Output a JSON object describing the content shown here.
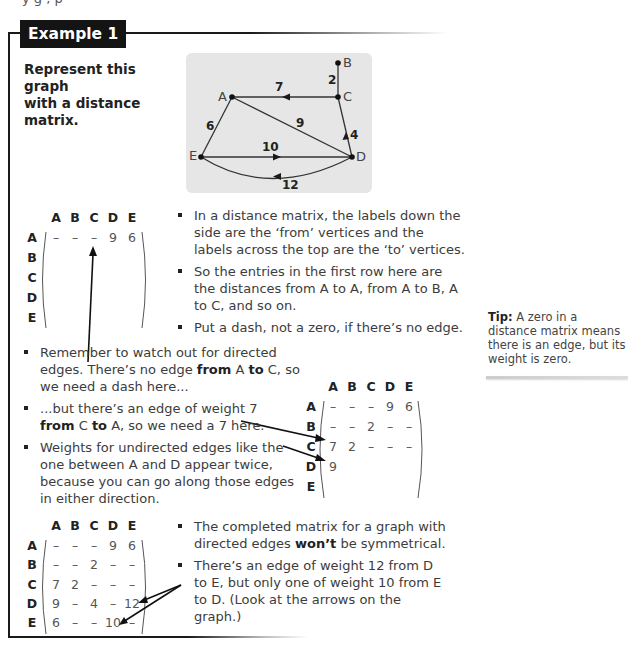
{
  "header": {
    "cut_text": "y g   ,           p",
    "example_label": "Example 1"
  },
  "prompt": {
    "line1": "Represent this graph",
    "line2": "with a distance matrix."
  },
  "graph": {
    "nodes": [
      {
        "id": "A",
        "x": 232,
        "y": 97
      },
      {
        "id": "B",
        "x": 338,
        "y": 63
      },
      {
        "id": "C",
        "x": 338,
        "y": 97
      },
      {
        "id": "D",
        "x": 352,
        "y": 157
      },
      {
        "id": "E",
        "x": 201,
        "y": 157
      }
    ],
    "edges": [
      {
        "from": "C",
        "to": "A",
        "weight": "7",
        "directed": true
      },
      {
        "from": "B",
        "to": "C",
        "weight": "2",
        "directed": false
      },
      {
        "from": "A",
        "to": "E",
        "weight": "6",
        "directed": false
      },
      {
        "from": "A",
        "to": "D",
        "weight": "9",
        "directed": false
      },
      {
        "from": "D",
        "to": "C",
        "weight": "4",
        "directed": true
      },
      {
        "from": "E",
        "to": "D",
        "weight": "10",
        "directed": true
      },
      {
        "from": "D",
        "to": "E",
        "weight": "12",
        "directed": true
      }
    ],
    "labels": {
      "A": "A",
      "B": "B",
      "C": "C",
      "D": "D",
      "E": "E"
    },
    "weights": {
      "ca": "7",
      "bc": "2",
      "ae": "6",
      "ad": "9",
      "dc": "4",
      "ed": "10",
      "de": "12"
    }
  },
  "matrix_headers": [
    "A",
    "B",
    "C",
    "D",
    "E"
  ],
  "matrix1": {
    "rows": [
      [
        "–",
        "–",
        "–",
        "9",
        "6"
      ],
      [
        "",
        "",
        "",
        "",
        ""
      ],
      [
        "",
        "",
        "",
        "",
        ""
      ],
      [
        "",
        "",
        "",
        "",
        ""
      ],
      [
        "",
        "",
        "",
        "",
        ""
      ]
    ]
  },
  "matrix2": {
    "rows": [
      [
        "–",
        "–",
        "–",
        "9",
        "6"
      ],
      [
        "–",
        "–",
        "2",
        "–",
        "–"
      ],
      [
        "7",
        "2",
        "–",
        "–",
        "–"
      ],
      [
        "9",
        "",
        "",
        "",
        ""
      ],
      [
        "",
        "",
        "",
        "",
        ""
      ]
    ]
  },
  "matrix3": {
    "rows": [
      [
        "–",
        "–",
        "–",
        "9",
        "6"
      ],
      [
        "–",
        "–",
        "2",
        "–",
        "–"
      ],
      [
        "7",
        "2",
        "–",
        "–",
        "–"
      ],
      [
        "9",
        "–",
        "4",
        "–",
        "12"
      ],
      [
        "6",
        "–",
        "–",
        "10",
        "–"
      ]
    ]
  },
  "notes1": [
    "In a distance matrix, the labels down the side are the ‘from’ vertices and the labels across the top are the ‘to’ vertices.",
    "So the entries in the first row here are the distances from A to A, from A to B, A to C, and so on.",
    "Put a dash, not a zero, if there’s no edge."
  ],
  "notes2": {
    "b1_pre": "Remember to watch out for directed edges. There’s no edge ",
    "b1_from": "from",
    "b1_mid": " A ",
    "b1_to": "to",
    "b1_post": " C, so we need a dash here...",
    "b2_pre": "...but there’s an edge of weight 7 ",
    "b2_from": "from",
    "b2_mid": " C ",
    "b2_to": "to",
    "b2_post": " A, so we need a 7 here.",
    "b3": "Weights for undirected edges like the one between A and D appear twice, because you can go along those edges in either direction."
  },
  "notes3": {
    "b1_pre": "The completed matrix for a graph with directed edges ",
    "b1_bold": "won’t",
    "b1_post": " be symmetrical.",
    "b2": "There’s an edge of weight 12 from D to E, but only one of weight 10 from E to D. (Look at the arrows on the graph.)"
  },
  "tip": {
    "label": "Tip:",
    "text": " A zero in a distance matrix means there is an edge, but its weight is zero."
  }
}
